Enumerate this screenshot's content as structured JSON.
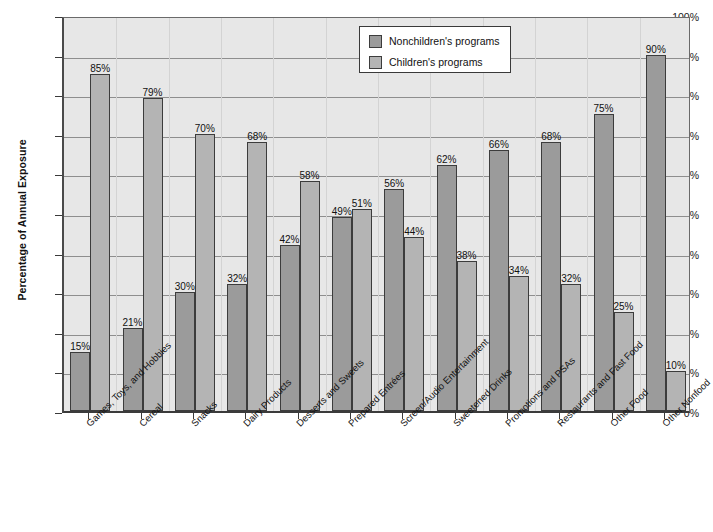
{
  "chart_data": {
    "type": "bar",
    "title": "",
    "xlabel": "",
    "ylabel": "Percentage of Annual Exposure",
    "ylim": [
      0,
      100
    ],
    "ytick_labels": [
      "100%",
      "90%",
      "80%",
      "70%",
      "60%",
      "50%",
      "40%",
      "30%",
      "20%",
      "10%",
      "0%"
    ],
    "ytick_values": [
      100,
      90,
      80,
      70,
      60,
      50,
      40,
      30,
      20,
      10,
      0
    ],
    "grid": true,
    "legend_position": "top-center-right",
    "categories": [
      "Games, Toys, and Hobbies",
      "Cereal",
      "Snacks",
      "Dairy Products",
      "Desserts and Sweets",
      "Prepared Entrées",
      "Screen/Audio Entertainment",
      "Sweetened Drinks",
      "Promotions and PSAs",
      "Restaurants and Fast Food",
      "Other Food",
      "Other Nonfood"
    ],
    "series": [
      {
        "name": "Nonchildren's programs",
        "color": "#9b9b9b",
        "values": [
          15,
          21,
          30,
          32,
          42,
          49,
          56,
          62,
          66,
          68,
          75,
          90
        ],
        "labels": [
          "15%",
          "21%",
          "30%",
          "32%",
          "42%",
          "49%",
          "56%",
          "62%",
          "66%",
          "68%",
          "75%",
          "90%"
        ]
      },
      {
        "name": "Children's programs",
        "color": "#b4b4b4",
        "values": [
          85,
          79,
          70,
          68,
          58,
          51,
          44,
          38,
          34,
          32,
          25,
          10
        ],
        "labels": [
          "85%",
          "79%",
          "70%",
          "68%",
          "58%",
          "51%",
          "44%",
          "38%",
          "34%",
          "32%",
          "25%",
          "10%"
        ]
      }
    ]
  },
  "legend": {
    "items": [
      {
        "label": "Nonchildren's programs",
        "swatch": "non"
      },
      {
        "label": "Children's programs",
        "swatch": "child"
      }
    ]
  },
  "colors": {
    "plot_background": "#e7e7e7",
    "gridline": "#8e8e8e",
    "axis": "#3a3a3a",
    "bar_nonchildren": "#9b9b9b",
    "bar_children": "#b4b4b4",
    "text": "#111111"
  }
}
